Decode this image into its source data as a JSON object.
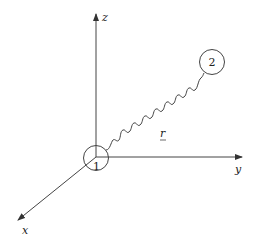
{
  "diagram": {
    "type": "3d-coordinate-system",
    "axes": {
      "x": {
        "label": "x"
      },
      "y": {
        "label": "y"
      },
      "z": {
        "label": "z"
      }
    },
    "particles": [
      {
        "id": "1",
        "label": "1"
      },
      {
        "id": "2",
        "label": "2"
      }
    ],
    "separation": {
      "label": "r",
      "style": "wavy",
      "underlined": true
    },
    "colors": {
      "line": "#333333",
      "background": "#ffffff"
    }
  }
}
